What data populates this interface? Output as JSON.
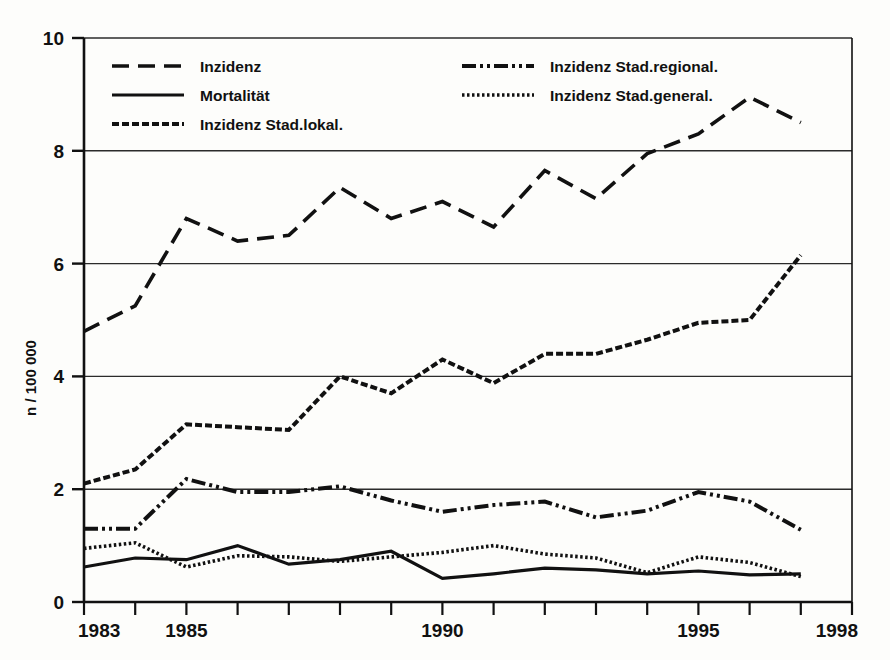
{
  "chart_data": {
    "type": "line",
    "title": "",
    "xlabel": "",
    "ylabel": "n / 100 000",
    "xlim": [
      1983,
      1998
    ],
    "ylim": [
      0,
      10
    ],
    "grid": true,
    "legend_position": "top-inside",
    "x": [
      1983,
      1984,
      1985,
      1986,
      1987,
      1988,
      1989,
      1990,
      1991,
      1992,
      1993,
      1994,
      1995,
      1996,
      1997
    ],
    "x_tick_labels": [
      "1983",
      "1985",
      "1990",
      "1995",
      "1998"
    ],
    "x_tick_values": [
      1983,
      1985,
      1990,
      1995,
      1998
    ],
    "y_tick_labels": [
      "0",
      "2",
      "4",
      "6",
      "8",
      "10"
    ],
    "y_tick_values": [
      0,
      2,
      4,
      6,
      8,
      10
    ],
    "series": [
      {
        "name": "Inzidenz",
        "style": "dashed",
        "values": [
          4.8,
          5.25,
          6.8,
          6.4,
          6.5,
          7.35,
          6.8,
          7.1,
          6.65,
          7.65,
          7.15,
          7.95,
          8.3,
          8.95,
          8.5
        ]
      },
      {
        "name": "Mortalität",
        "style": "solid",
        "values": [
          0.62,
          0.78,
          0.75,
          1.0,
          0.67,
          0.75,
          0.9,
          0.42,
          0.5,
          0.6,
          0.57,
          0.5,
          0.55,
          0.48,
          0.5
        ]
      },
      {
        "name": "Inzidenz Stad.lokal.",
        "style": "dense-dash",
        "values": [
          2.1,
          2.35,
          3.15,
          3.1,
          3.05,
          4.0,
          3.7,
          4.3,
          3.88,
          4.4,
          4.4,
          4.65,
          4.95,
          5.0,
          6.15
        ]
      },
      {
        "name": "Inzidenz Stad.regional.",
        "style": "dash-dot-dot",
        "values": [
          1.3,
          1.3,
          2.18,
          1.95,
          1.95,
          2.05,
          1.8,
          1.6,
          1.72,
          1.78,
          1.5,
          1.62,
          1.95,
          1.78,
          1.28
        ]
      },
      {
        "name": "Inzidenz Stad.general.",
        "style": "dotted",
        "values": [
          0.95,
          1.05,
          0.62,
          0.82,
          0.8,
          0.72,
          0.8,
          0.88,
          1.0,
          0.85,
          0.78,
          0.52,
          0.8,
          0.7,
          0.45
        ]
      }
    ],
    "legend": [
      {
        "label": "Inzidenz",
        "style": "dashed"
      },
      {
        "label": "Mortalität",
        "style": "solid"
      },
      {
        "label": "Inzidenz Stad.lokal.",
        "style": "dense-dash"
      },
      {
        "label": "Inzidenz Stad.regional.",
        "style": "dash-dot-dot"
      },
      {
        "label": "Inzidenz Stad.general.",
        "style": "dotted"
      }
    ],
    "colors": {
      "line": "#111111",
      "grid": "#2b2b2b",
      "axis": "#111111",
      "background": "#fdfdfb"
    }
  }
}
